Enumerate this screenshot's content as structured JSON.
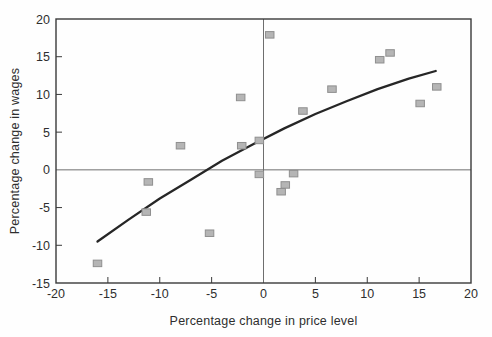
{
  "chart_data": {
    "type": "scatter",
    "title": "",
    "xlabel": "Percentage change in price level",
    "ylabel": "Percentage change in wages",
    "xlim": [
      -20,
      20
    ],
    "ylim": [
      -15,
      20
    ],
    "x_ticks": [
      -20,
      -15,
      -10,
      -5,
      0,
      5,
      10,
      15,
      20
    ],
    "y_ticks": [
      -15,
      -10,
      -5,
      0,
      5,
      10,
      15,
      20
    ],
    "grid": false,
    "zero_lines": true,
    "legend": "none",
    "marker": {
      "shape": "square",
      "w": 8.5,
      "h": 6.5
    },
    "points": [
      {
        "x": 0.6,
        "y": 17.9
      },
      {
        "x": 12.2,
        "y": 15.5
      },
      {
        "x": 11.2,
        "y": 14.6
      },
      {
        "x": 16.7,
        "y": 11.0
      },
      {
        "x": 15.1,
        "y": 8.8
      },
      {
        "x": 6.6,
        "y": 10.7
      },
      {
        "x": 3.8,
        "y": 7.8
      },
      {
        "x": -2.2,
        "y": 9.6
      },
      {
        "x": -0.4,
        "y": 3.9
      },
      {
        "x": -2.1,
        "y": 3.2
      },
      {
        "x": -8.0,
        "y": 3.2
      },
      {
        "x": 2.9,
        "y": -0.5
      },
      {
        "x": -0.4,
        "y": -0.6
      },
      {
        "x": 2.1,
        "y": -2.0
      },
      {
        "x": 1.7,
        "y": -2.9
      },
      {
        "x": -11.1,
        "y": -1.6
      },
      {
        "x": -11.3,
        "y": -5.6
      },
      {
        "x": -5.2,
        "y": -8.4
      },
      {
        "x": -16.0,
        "y": -12.4
      }
    ],
    "trend_line": [
      [
        -16.0,
        -9.5
      ],
      [
        -13.0,
        -6.6
      ],
      [
        -10.0,
        -3.8
      ],
      [
        -7.0,
        -1.3
      ],
      [
        -4.0,
        1.2
      ],
      [
        -1.0,
        3.4
      ],
      [
        2.0,
        5.5
      ],
      [
        5.0,
        7.4
      ],
      [
        8.0,
        9.1
      ],
      [
        11.0,
        10.7
      ],
      [
        14.0,
        12.1
      ],
      [
        16.6,
        13.1
      ]
    ],
    "colors": {
      "background": "#fefefe",
      "marker_fill": "#b5b5b5",
      "marker_stroke": "#8f8f8f",
      "trend": "#262626",
      "axis": "#3a3a3a",
      "zero_line": "#6e6e6e",
      "text": "#2e2e2e"
    }
  }
}
